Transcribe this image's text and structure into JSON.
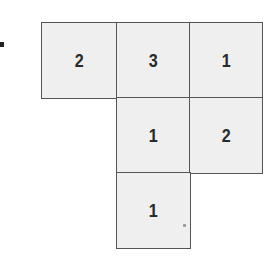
{
  "figure": {
    "type": "net-grid",
    "cells": [
      {
        "row": 0,
        "col": 0,
        "value": "2"
      },
      {
        "row": 0,
        "col": 1,
        "value": "3"
      },
      {
        "row": 0,
        "col": 2,
        "value": "1"
      },
      {
        "row": 1,
        "col": 1,
        "value": "1"
      },
      {
        "row": 1,
        "col": 2,
        "value": "2"
      },
      {
        "row": 2,
        "col": 1,
        "value": "1"
      }
    ]
  }
}
